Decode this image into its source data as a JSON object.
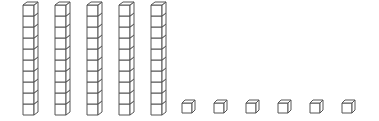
{
  "diagram": {
    "represented_number": 56,
    "tens": {
      "count": 5,
      "cubes_per_rod": 10,
      "icon": "ten-rod-icon"
    },
    "ones": {
      "count": 6,
      "icon": "unit-cube-icon"
    },
    "colors": {
      "stroke": "#555555",
      "fill": "#ffffff",
      "background": "#ffffff"
    }
  }
}
